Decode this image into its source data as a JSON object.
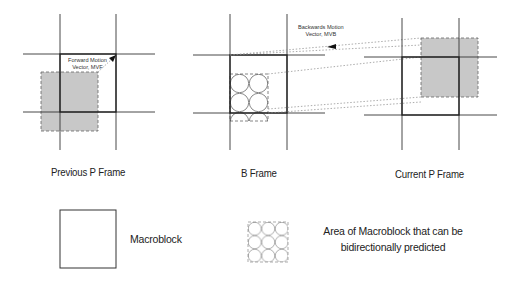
{
  "diagram": {
    "frames": [
      {
        "id": "previous-p-frame",
        "label": "Previous P Frame"
      },
      {
        "id": "b-frame",
        "label": "B Frame"
      },
      {
        "id": "current-p-frame",
        "label": "Current P Frame"
      }
    ],
    "annotations": {
      "forward_vector": {
        "line1": "Forward Motion",
        "line2": "Vector, MVF"
      },
      "backward_vector": {
        "line1": "Backwards Motion",
        "line2": "Vector, MVB"
      }
    },
    "legend": {
      "macroblock": "Macroblock",
      "bidirectional_line1": "Area of Macroblock that can be",
      "bidirectional_line2": "bidirectionally predicted"
    },
    "colors": {
      "grid_line": "#333333",
      "shaded_fill": "#c8c8c8",
      "dashed_border": "#666666",
      "circle_stroke": "#555555"
    }
  }
}
